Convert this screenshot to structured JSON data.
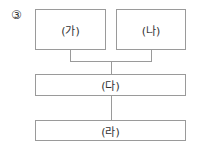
{
  "diagram": {
    "option_marker": "③",
    "boxes": {
      "ga": "(가)",
      "na": "(나)",
      "da": "(다)",
      "ra": "(라)"
    },
    "edges": [
      {
        "from": "ga",
        "to": "da"
      },
      {
        "from": "na",
        "to": "da"
      },
      {
        "from": "da",
        "to": "ra"
      }
    ],
    "colors": {
      "line": "#9a9a9a",
      "text": "#333333"
    }
  }
}
